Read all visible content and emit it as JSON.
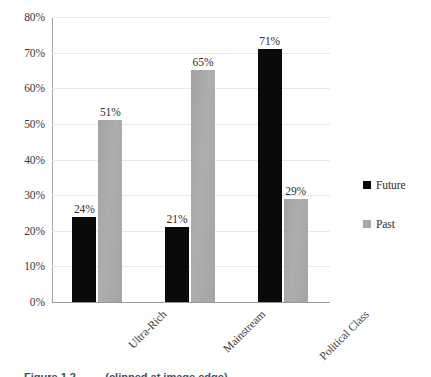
{
  "chart_data": {
    "type": "bar",
    "title": "",
    "xlabel": "",
    "ylabel": "",
    "categories": [
      "Ultra-Rich",
      "Mainstream",
      "Political Class"
    ],
    "series": [
      {
        "name": "Future",
        "color": "#0a0a0a",
        "values": [
          24,
          21,
          71
        ],
        "labels": [
          "24%",
          "21%",
          "71%"
        ]
      },
      {
        "name": "Past",
        "color": "#a8a8a8",
        "values": [
          51,
          65,
          29
        ],
        "labels": [
          "51%",
          "65%",
          "29%"
        ]
      }
    ],
    "ylim": [
      0,
      80
    ],
    "y_tick_step": 10,
    "y_tick_labels": [
      "80%",
      "70%",
      "60%",
      "50%",
      "40%",
      "30%",
      "20%",
      "10%",
      "0%"
    ],
    "grid": "horizontal",
    "legend_position": "right",
    "value_labels_shown": true
  },
  "legend": {
    "entries": [
      {
        "label": "Future",
        "swatch": "#0a0a0a"
      },
      {
        "label": "Past",
        "swatch": "#a8a8a8"
      }
    ]
  },
  "caption": {
    "text": "Figure 1.2 — ... (clipped at image edge)"
  }
}
